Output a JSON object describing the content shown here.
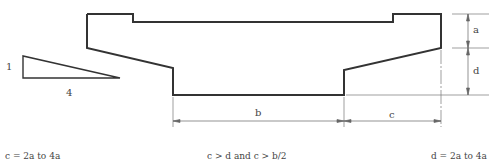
{
  "diagram": {
    "slope_triangle": {
      "rise_label": "1",
      "run_label": "4"
    },
    "dimensions": {
      "a": "a",
      "d": "d",
      "b": "b",
      "c": "c"
    },
    "captions": {
      "left": "c = 2a to 4a",
      "middle": "c > d and c > b/2",
      "right": "d = 2a to 4a"
    },
    "colors": {
      "outline": "#333333",
      "dim_line": "#666666",
      "text": "#444444"
    }
  }
}
